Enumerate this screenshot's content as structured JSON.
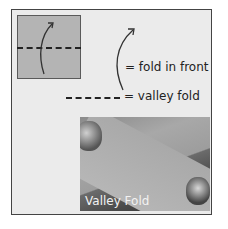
{
  "legend": {
    "fold_in_front_label": "= fold in front",
    "valley_fold_label": "= valley fold"
  },
  "photo": {
    "caption": "Valley Fold"
  },
  "colors": {
    "frame_background": "#ebebeb",
    "square_fill": "#b4b4b4",
    "line": "#222222"
  }
}
